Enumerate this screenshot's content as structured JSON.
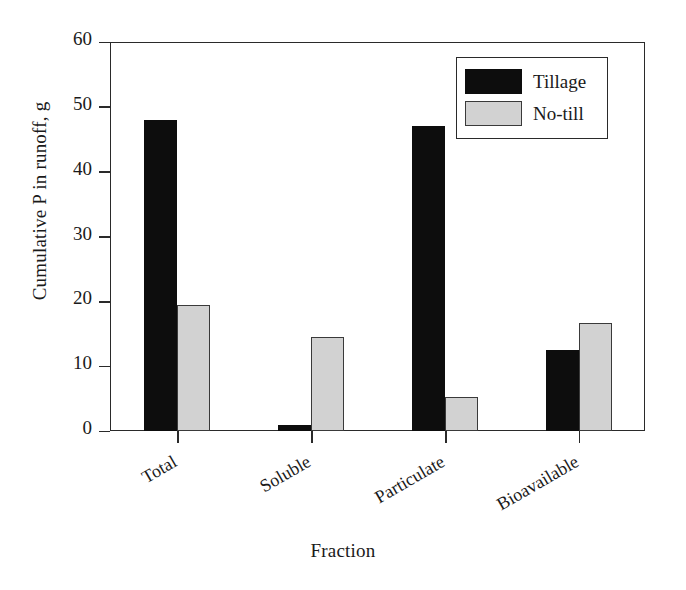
{
  "chart_data": {
    "type": "bar",
    "title": "",
    "xlabel": "Fraction",
    "ylabel": "Cumulative P in runoff, g",
    "categories": [
      "Total",
      "Soluble",
      "Particulate",
      "Bioavailable"
    ],
    "series": [
      {
        "name": "Tillage",
        "values": [
          48,
          1,
          47,
          12.5
        ],
        "color": "#0d0d0d"
      },
      {
        "name": "No-till",
        "values": [
          19.5,
          14.5,
          5.2,
          16.6
        ],
        "color": "#d2d2d2"
      }
    ],
    "ylim": [
      0,
      60
    ],
    "yticks": [
      0,
      10,
      20,
      30,
      40,
      50,
      60
    ],
    "ytick_labels": [
      "0",
      "10",
      "20",
      "30",
      "40",
      "50",
      "60"
    ],
    "grid": false,
    "legend_position": "top-right",
    "xtick_label_rotation": -30
  },
  "legend": {
    "entries": [
      {
        "label": "Tillage",
        "swatch": "black-filled-swatch"
      },
      {
        "label": "No-till",
        "swatch": "gray-filled-swatch"
      }
    ]
  },
  "axes": {
    "y_title": "Cumulative P in runoff, g",
    "x_title": "Fraction"
  }
}
